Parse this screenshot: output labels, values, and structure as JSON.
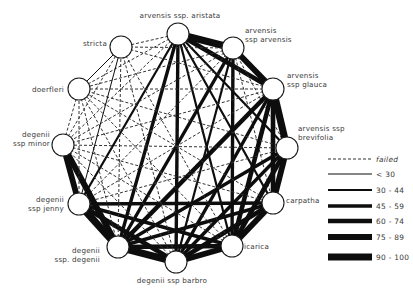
{
  "diagram": {
    "type": "network",
    "nodes": [
      {
        "id": "aristata",
        "label_lines": [
          "arvensis  ssp. aristata"
        ],
        "x": 178,
        "y": 34,
        "label_x": 180,
        "label_y": 18,
        "anchor": "middle"
      },
      {
        "id": "arvensis",
        "label_lines": [
          "arvensis",
          "ssp arvensis"
        ],
        "x": 233,
        "y": 48,
        "label_x": 245,
        "label_y": 33,
        "anchor": "start"
      },
      {
        "id": "glauca",
        "label_lines": [
          "arvensis",
          "ssp glauca"
        ],
        "x": 273,
        "y": 89,
        "label_x": 287,
        "label_y": 78,
        "anchor": "start"
      },
      {
        "id": "brevifolia",
        "label_lines": [
          "arvensis ssp",
          "brevifolia"
        ],
        "x": 287,
        "y": 148,
        "label_x": 298,
        "label_y": 131,
        "anchor": "start"
      },
      {
        "id": "carpatha",
        "label_lines": [
          "carpatha"
        ],
        "x": 273,
        "y": 203,
        "label_x": 286,
        "label_y": 203,
        "anchor": "start"
      },
      {
        "id": "icarica",
        "label_lines": [
          "icarica"
        ],
        "x": 232,
        "y": 246,
        "label_x": 244,
        "label_y": 249,
        "anchor": "start"
      },
      {
        "id": "barbro",
        "label_lines": [
          "degenii  ssp barbro"
        ],
        "x": 176,
        "y": 262,
        "label_x": 172,
        "label_y": 283,
        "anchor": "middle"
      },
      {
        "id": "degenii",
        "label_lines": [
          "degenii",
          "ssp. degenii"
        ],
        "x": 118,
        "y": 247,
        "label_x": 100,
        "label_y": 253,
        "anchor": "end"
      },
      {
        "id": "jenny",
        "label_lines": [
          "degenii",
          "ssp jenny"
        ],
        "x": 79,
        "y": 204,
        "label_x": 64,
        "label_y": 202,
        "anchor": "end"
      },
      {
        "id": "minor",
        "label_lines": [
          "degenii",
          "ssp minor"
        ],
        "x": 63,
        "y": 145,
        "label_x": 50,
        "label_y": 137,
        "anchor": "end"
      },
      {
        "id": "doerfleri",
        "label_lines": [
          "doerfleri"
        ],
        "x": 79,
        "y": 89,
        "label_x": 64,
        "label_y": 92,
        "anchor": "end"
      },
      {
        "id": "stricta",
        "label_lines": [
          "stricta"
        ],
        "x": 121,
        "y": 47,
        "label_x": 107,
        "label_y": 46,
        "anchor": "end"
      }
    ],
    "node_radius": 11,
    "edges": [
      {
        "from": "aristata",
        "to": "arvensis",
        "class": "90-100"
      },
      {
        "from": "aristata",
        "to": "glauca",
        "class": "60-74"
      },
      {
        "from": "aristata",
        "to": "brevifolia",
        "class": "30-44"
      },
      {
        "from": "aristata",
        "to": "carpatha",
        "class": "30-44"
      },
      {
        "from": "aristata",
        "to": "icarica",
        "class": "30-44"
      },
      {
        "from": "aristata",
        "to": "barbro",
        "class": "45-59"
      },
      {
        "from": "aristata",
        "to": "degenii",
        "class": "45-59"
      },
      {
        "from": "aristata",
        "to": "jenny",
        "class": "30-44"
      },
      {
        "from": "aristata",
        "to": "minor",
        "class": "failed"
      },
      {
        "from": "aristata",
        "to": "doerfleri",
        "class": "failed"
      },
      {
        "from": "aristata",
        "to": "stricta",
        "class": "failed"
      },
      {
        "from": "arvensis",
        "to": "glauca",
        "class": "75-89"
      },
      {
        "from": "arvensis",
        "to": "brevifolia",
        "class": "failed"
      },
      {
        "from": "arvensis",
        "to": "carpatha",
        "class": "failed"
      },
      {
        "from": "arvensis",
        "to": "icarica",
        "class": "45-59"
      },
      {
        "from": "arvensis",
        "to": "barbro",
        "class": "30-44"
      },
      {
        "from": "arvensis",
        "to": "degenii",
        "class": "45-59"
      },
      {
        "from": "arvensis",
        "to": "jenny",
        "class": "failed"
      },
      {
        "from": "arvensis",
        "to": "minor",
        "class": "failed"
      },
      {
        "from": "arvensis",
        "to": "doerfleri",
        "class": "failed"
      },
      {
        "from": "arvensis",
        "to": "stricta",
        "class": "failed"
      },
      {
        "from": "glauca",
        "to": "brevifolia",
        "class": "90-100"
      },
      {
        "from": "glauca",
        "to": "carpatha",
        "class": "60-74"
      },
      {
        "from": "glauca",
        "to": "icarica",
        "class": "60-74"
      },
      {
        "from": "glauca",
        "to": "barbro",
        "class": "45-59"
      },
      {
        "from": "glauca",
        "to": "degenii",
        "class": "60-74"
      },
      {
        "from": "glauca",
        "to": "jenny",
        "class": "failed"
      },
      {
        "from": "glauca",
        "to": "minor",
        "class": "failed"
      },
      {
        "from": "glauca",
        "to": "doerfleri",
        "class": "failed"
      },
      {
        "from": "glauca",
        "to": "stricta",
        "class": "failed"
      },
      {
        "from": "brevifolia",
        "to": "carpatha",
        "class": "75-89"
      },
      {
        "from": "brevifolia",
        "to": "icarica",
        "class": "60-74"
      },
      {
        "from": "brevifolia",
        "to": "barbro",
        "class": "45-59"
      },
      {
        "from": "brevifolia",
        "to": "degenii",
        "class": "45-59"
      },
      {
        "from": "brevifolia",
        "to": "jenny",
        "class": "failed"
      },
      {
        "from": "brevifolia",
        "to": "minor",
        "class": "failed"
      },
      {
        "from": "brevifolia",
        "to": "doerfleri",
        "class": "failed"
      },
      {
        "from": "carpatha",
        "to": "icarica",
        "class": "75-89"
      },
      {
        "from": "carpatha",
        "to": "barbro",
        "class": "60-74"
      },
      {
        "from": "carpatha",
        "to": "degenii",
        "class": "45-59"
      },
      {
        "from": "carpatha",
        "to": "jenny",
        "class": "45-59"
      },
      {
        "from": "carpatha",
        "to": "minor",
        "class": "failed"
      },
      {
        "from": "carpatha",
        "to": "doerfleri",
        "class": "failed"
      },
      {
        "from": "icarica",
        "to": "barbro",
        "class": "75-89"
      },
      {
        "from": "icarica",
        "to": "degenii",
        "class": "60-74"
      },
      {
        "from": "icarica",
        "to": "jenny",
        "class": "45-59"
      },
      {
        "from": "icarica",
        "to": "minor",
        "class": "failed"
      },
      {
        "from": "icarica",
        "to": "doerfleri",
        "class": "failed"
      },
      {
        "from": "icarica",
        "to": "stricta",
        "class": "failed"
      },
      {
        "from": "barbro",
        "to": "degenii",
        "class": "90-100"
      },
      {
        "from": "barbro",
        "to": "jenny",
        "class": "60-74"
      },
      {
        "from": "barbro",
        "to": "minor",
        "class": "failed"
      },
      {
        "from": "barbro",
        "to": "doerfleri",
        "class": "failed"
      },
      {
        "from": "barbro",
        "to": "stricta",
        "class": "failed"
      },
      {
        "from": "degenii",
        "to": "jenny",
        "class": "90-100"
      },
      {
        "from": "degenii",
        "to": "minor",
        "class": "75-89"
      },
      {
        "from": "degenii",
        "to": "doerfleri",
        "class": "failed"
      },
      {
        "from": "degenii",
        "to": "stricta",
        "class": "failed"
      },
      {
        "from": "jenny",
        "to": "minor",
        "class": "75-89"
      },
      {
        "from": "jenny",
        "to": "doerfleri",
        "class": "failed"
      },
      {
        "from": "jenny",
        "to": "stricta",
        "class": "<30"
      },
      {
        "from": "minor",
        "to": "doerfleri",
        "class": "failed"
      },
      {
        "from": "minor",
        "to": "stricta",
        "class": "failed"
      },
      {
        "from": "doerfleri",
        "to": "stricta",
        "class": "<30"
      }
    ],
    "legend": {
      "x1": 328,
      "x2": 372,
      "label_x": 376,
      "items": [
        {
          "class": "failed",
          "label": "failed",
          "y": 159,
          "width": 1.0,
          "dashed": true
        },
        {
          "class": "<30",
          "label": "< 30",
          "y": 174,
          "width": 1.0,
          "dashed": false
        },
        {
          "class": "30-44",
          "label": "30 - 44",
          "y": 190,
          "width": 2.2,
          "dashed": false
        },
        {
          "class": "45-59",
          "label": "45 - 59",
          "y": 206,
          "width": 3.4,
          "dashed": false
        },
        {
          "class": "60-74",
          "label": "60 - 74",
          "y": 221,
          "width": 4.6,
          "dashed": false
        },
        {
          "class": "75-89",
          "label": "75 - 89",
          "y": 237,
          "width": 5.8,
          "dashed": false
        },
        {
          "class": "90-100",
          "label": "90 - 100",
          "y": 257,
          "width": 7.2,
          "dashed": false
        }
      ]
    }
  }
}
